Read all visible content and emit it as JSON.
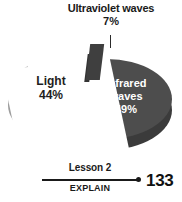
{
  "chart_data": {
    "type": "pie",
    "title": "",
    "categories": [
      "Ultraviolet waves",
      "Light",
      "Infrared waves"
    ],
    "values": [
      7,
      44,
      49
    ],
    "value_unit": "%",
    "labels": [
      {
        "name": "Ultraviolet waves",
        "value": 7,
        "value_text": "7%",
        "placement": "callout-top",
        "color": "#3f3f3f",
        "text_color": "#1a1a1a"
      },
      {
        "name": "Light",
        "value": 44,
        "value_text": "44%",
        "placement": "inside-left",
        "color": "#c9c9c9",
        "text_color": "#1e1e1e"
      },
      {
        "name": "Infrared waves",
        "value": 49,
        "value_text": "49%",
        "placement": "inside-right",
        "color": "#4d4d4d",
        "text_color": "#ffffff"
      }
    ],
    "exploded_slice": "Infrared waves",
    "three_d": true,
    "legend": "none",
    "grid": false
  },
  "callout": {
    "title": "Ultraviolet waves",
    "percent": "7%"
  },
  "slices": {
    "light": {
      "label": "Light",
      "percent": "44%"
    },
    "infrared": {
      "label_line1": "Infrared",
      "label_line2": "waves",
      "percent": "49%"
    }
  },
  "footer": {
    "lesson": "Lesson 2",
    "section": "EXPLAIN",
    "page_number": "133"
  },
  "colors": {
    "light_slice": "#c9c9c9",
    "light_slice_side": "#9d9d9d",
    "dark_slice": "#4d4d4d",
    "dark_slice_side": "#3b3b3b",
    "uv_slice": "#3f3f3f",
    "background": "#ffffff",
    "text": "#1a1a1a"
  }
}
